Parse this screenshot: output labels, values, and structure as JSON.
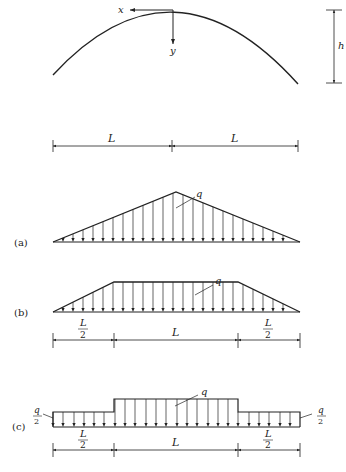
{
  "arch": {
    "axis_x_label": "x",
    "axis_y_label": "y",
    "height_label": "h",
    "span_labels": [
      "L",
      "L"
    ]
  },
  "cases": [
    {
      "id": "a",
      "label": "(a)",
      "load_shape": "triangular",
      "load_label": "q"
    },
    {
      "id": "b",
      "label": "(b)",
      "load_shape": "trapezoidal",
      "load_label": "q",
      "dimensions": [
        {
          "num": "L",
          "den": "2"
        },
        {
          "text": "L"
        },
        {
          "num": "L",
          "den": "2"
        }
      ]
    },
    {
      "id": "c",
      "label": "(c)",
      "load_shape": "stepped",
      "load_label": "q",
      "side_load_label": {
        "num": "q",
        "den": "2"
      },
      "dimensions": [
        {
          "num": "L",
          "den": "2"
        },
        {
          "text": "L"
        },
        {
          "num": "L",
          "den": "2"
        }
      ]
    }
  ]
}
